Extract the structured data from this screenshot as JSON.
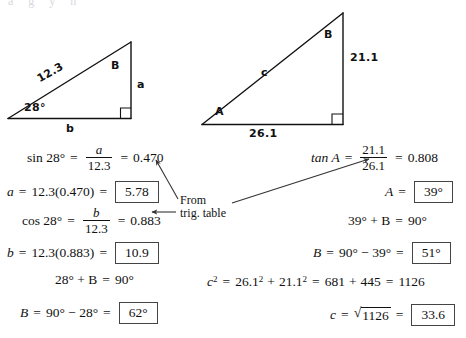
{
  "page": {
    "top_clipped_text": "a  g  y  h"
  },
  "figures": {
    "left_triangle": {
      "name": "right-triangle-left",
      "hypotenuse_label": "12.3",
      "angle_label": "28°",
      "vertex_b_label": "B",
      "opposite_label": "a",
      "adjacent_label": "b",
      "right_angle_marker": "square"
    },
    "right_triangle": {
      "name": "right-triangle-right",
      "hypotenuse_label": "c",
      "vertex_a_label": "A",
      "vertex_b_label": "B",
      "opposite_label": "21.1",
      "adjacent_label": "26.1",
      "right_angle_marker": "square"
    }
  },
  "annotation": {
    "line1": "From",
    "line2": "trig. table"
  },
  "left_work": {
    "step1": {
      "fn": "sin 28°",
      "eq1": "=",
      "num": "a",
      "den": "12.3",
      "eq2": "=",
      "value": "0.470"
    },
    "step2": {
      "var": "a",
      "eq1": "=",
      "expr": "12.3(0.470)",
      "eq2": "=",
      "boxed": "5.78"
    },
    "step3": {
      "fn": "cos 28°",
      "eq1": "=",
      "num": "b",
      "den": "12.3",
      "eq2": "=",
      "value": "0.883"
    },
    "step4": {
      "var": "b",
      "eq1": "=",
      "expr": "12.3(0.883)",
      "eq2": "=",
      "boxed": "10.9"
    },
    "step5": {
      "lhs": "28° + B",
      "eq": "=",
      "rhs": "90°"
    },
    "step6": {
      "var": "B",
      "eq1": "=",
      "expr": "90° − 28°",
      "eq2": "=",
      "boxed": "62°"
    }
  },
  "right_work": {
    "step1": {
      "fn": "tan A",
      "eq1": "=",
      "num": "21.1",
      "den": "26.1",
      "eq2": "=",
      "value": "0.808"
    },
    "step2": {
      "var": "A",
      "eq1": "=",
      "boxed": "39°"
    },
    "step3": {
      "lhs": "39° + B",
      "eq": "=",
      "rhs": "90°"
    },
    "step4": {
      "var": "B",
      "eq1": "=",
      "expr": "90° − 39°",
      "eq2": "=",
      "boxed": "51°"
    },
    "step5": {
      "var": "c",
      "sup": "2",
      "eq1": "=",
      "t1": "26.1",
      "t1sup": "2",
      "plus": "+",
      "t2": "21.1",
      "t2sup": "2",
      "eq2": "=",
      "s1": "681",
      "plus2": "+",
      "s2": "445",
      "eq3": "=",
      "total": "1126"
    },
    "step6": {
      "var": "c",
      "eq1": "=",
      "radical": "√",
      "radicand": "1126",
      "eq2": "=",
      "boxed": "33.6"
    }
  },
  "colors": {
    "ink": "#111111",
    "box_border": "#444444",
    "background": "#ffffff"
  }
}
